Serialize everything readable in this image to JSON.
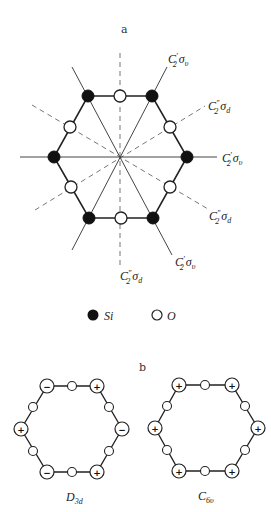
{
  "panel_a": {
    "label": "a",
    "axes": [
      {
        "id": "top_right",
        "c": "C",
        "prime": "′",
        "sub": "2",
        "sigma": "σ",
        "sigma_sub": "υ"
      },
      {
        "id": "upper_right",
        "c": "C",
        "prime": "″",
        "sub": "2",
        "sigma": "σ",
        "sigma_sub": "d"
      },
      {
        "id": "right",
        "c": "C",
        "prime": "′",
        "sub": "2",
        "sigma": "σ",
        "sigma_sub": "υ"
      },
      {
        "id": "lower_right",
        "c": "C",
        "prime": "″",
        "sub": "2",
        "sigma": "σ",
        "sigma_sub": "d"
      },
      {
        "id": "bottom_right",
        "c": "C",
        "prime": "′",
        "sub": "2",
        "sigma": "σ",
        "sigma_sub": "υ"
      },
      {
        "id": "bottom",
        "c": "C",
        "prime": "″",
        "sub": "2",
        "sigma": "σ",
        "sigma_sub": "d"
      }
    ],
    "atoms": {
      "si_count": 6,
      "o_count": 6
    },
    "legend": {
      "si_label": "Si",
      "o_label": "O"
    }
  },
  "panel_b": {
    "label": "b",
    "structures": [
      {
        "name": "D",
        "sub": "3d",
        "signs": [
          "−",
          "+",
          "−",
          "+",
          "−",
          "+"
        ]
      },
      {
        "name": "C",
        "sub": "6υ",
        "signs": [
          "+",
          "+",
          "+",
          "+",
          "+",
          "+"
        ]
      }
    ]
  }
}
